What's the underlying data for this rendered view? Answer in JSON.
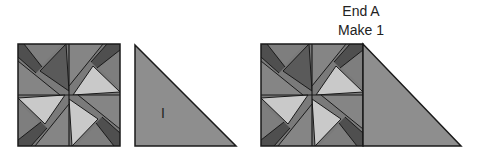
{
  "caption": {
    "title": "End A",
    "subtitle": "Make 1"
  },
  "pieces": {
    "triangle_label": "I"
  },
  "colors": {
    "light": "#c9c9c9",
    "medium_light": "#8c8c8c",
    "medium": "#7a7a7a",
    "dark": "#4f4f4f",
    "triangle": "#8e8e8e",
    "outline": "#1a1a1a"
  }
}
